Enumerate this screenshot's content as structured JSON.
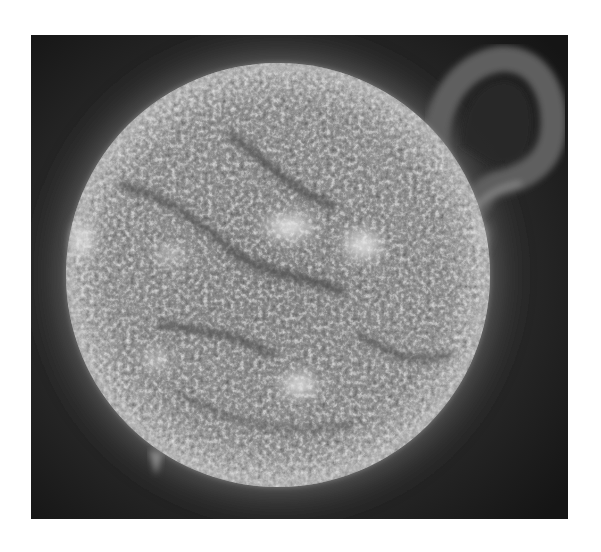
{
  "image": {
    "subject": "Grayscale extreme-ultraviolet image of the Sun with a large prominence on the upper-right limb",
    "alt": "Sun disk in grayscale with bright active regions and a looping solar prominence",
    "colors": {
      "background": "#ffffff",
      "space": "#1c1c1c",
      "disk_center": "#8a8a8a",
      "disk_limb": "#b8b8b8",
      "active_region": "#f2f2f2",
      "filament": "#4a4a4a",
      "prominence": "#5a5a5a"
    },
    "features": {
      "disk": {
        "cx": 247,
        "cy": 240,
        "r": 212
      },
      "prominence": {
        "position": "upper-right limb",
        "shape": "loop"
      },
      "active_regions": [
        {
          "name": "left-limb-bright",
          "cx": 52,
          "cy": 205
        },
        {
          "name": "center-bright",
          "cx": 260,
          "cy": 190
        },
        {
          "name": "right-center-bright",
          "cx": 330,
          "cy": 210
        },
        {
          "name": "lower-center-bright",
          "cx": 268,
          "cy": 350
        },
        {
          "name": "lower-left-bright",
          "cx": 125,
          "cy": 325
        }
      ]
    }
  }
}
